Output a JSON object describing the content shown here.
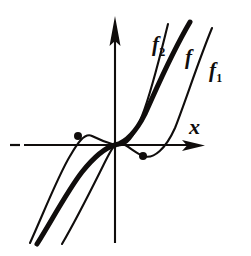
{
  "figure": {
    "background_color": "#ffffff",
    "ink_color": "#100d0c",
    "axes": {
      "x_axis_label": "x",
      "x_axis_label_name": "x-axis-label",
      "y_axis_label": "",
      "x_axis_y_pixel": 145,
      "y_axis_x_pixel": 115,
      "x_axis_from_pixel": 10,
      "x_axis_to_pixel": 205,
      "y_axis_from_pixel": 16,
      "y_axis_to_pixel": 243,
      "x_axis_has_arrow": true,
      "y_axis_has_arrow": true,
      "x_axis_left_dashed": true
    },
    "curve_labels": {
      "f2": {
        "base": "f",
        "sub": "2"
      },
      "f": {
        "base": "f",
        "sub": ""
      },
      "f1": {
        "base": "f",
        "sub": "1"
      }
    },
    "markers": [
      {
        "name": "marker-left-dot",
        "x": 78,
        "y": 136,
        "radius": 4.0
      },
      {
        "name": "marker-right-dot",
        "x": 143,
        "y": 156,
        "radius": 4.0
      }
    ]
  },
  "chart_data": {
    "type": "line",
    "xlabel": "x",
    "ylabel": "",
    "grid": false,
    "legend": "inline-curve-labels",
    "origin_pixel": {
      "x": 115,
      "y": 145
    },
    "axis_ranges_pixel": {
      "x": [
        10,
        205
      ],
      "y": [
        16,
        243
      ]
    },
    "series": [
      {
        "name": "f_2",
        "label": "f2",
        "stroke": "thin",
        "description": "Leftmost/uppermost curve: rises most steeply, has a local maximum at the left marked dot above the x-axis, passes through the origin.",
        "path": "M 30 243 C 44 212, 58 176, 70 156 C 76 146, 84 132, 92 136 C 100 140, 104 142, 115 145 C 127 148, 134 136, 142 116 C 152 90, 160 56, 168 24"
      },
      {
        "name": "f",
        "label": "f",
        "stroke": "thick",
        "description": "Middle bold curve: monotone increasing, inflection at the origin, lies between f_2 and f_1.",
        "path": "M 37 244 C 52 220, 68 190, 82 172 C 94 157, 104 148, 115 145 C 127 142, 136 132, 145 114 C 156 90, 170 56, 190 22"
      },
      {
        "name": "f_1",
        "label": "f1",
        "stroke": "thin",
        "description": "Rightmost/lowest curve: passes through the origin, dips to a local minimum at the right marked dot below the x-axis, then rises steeply.",
        "path": "M 62 244 C 76 220, 90 192, 100 172 C 107 158, 111 149, 115 145 C 122 139, 130 150, 143 156 C 154 160, 166 148, 175 128 C 186 100, 198 62, 212 28"
      }
    ],
    "annotations": [
      {
        "text": "f2",
        "x": 155,
        "y": 48,
        "name": "label-f2"
      },
      {
        "text": "f",
        "x": 190,
        "y": 58,
        "name": "label-f"
      },
      {
        "text": "f1",
        "x": 215,
        "y": 73,
        "name": "label-f1"
      },
      {
        "text": "x",
        "x": 196,
        "y": 128,
        "name": "label-x"
      }
    ],
    "marked_points": [
      {
        "name": "local-maximum-of-f2",
        "pixel_x": 78,
        "pixel_y": 136
      },
      {
        "name": "local-minimum-of-f1",
        "pixel_x": 143,
        "pixel_y": 156
      }
    ]
  }
}
